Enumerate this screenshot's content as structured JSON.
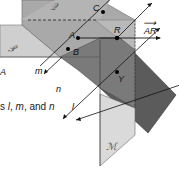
{
  "figure": {
    "planes": [
      {
        "name": "P",
        "script_label": "𝒫",
        "fill": "#c9c9c9"
      },
      {
        "name": "Q",
        "script_label": "𝒬",
        "fill": "#a8a8a8"
      },
      {
        "name": "M",
        "script_label": "ℳ",
        "fill": "#d8d8d8"
      },
      {
        "name": "dark",
        "fill": "#5a5a5a"
      }
    ],
    "points": [
      {
        "label": "C"
      },
      {
        "label": "A"
      },
      {
        "label": "B"
      },
      {
        "label": "R"
      },
      {
        "label": "Y"
      }
    ],
    "lines": [
      {
        "label": "m"
      },
      {
        "label": "n"
      },
      {
        "label": "l"
      }
    ],
    "ray_label": "AR",
    "ray_overbar": "⟶",
    "left_letter": "A",
    "caption": {
      "prefix": "s ",
      "l": "l",
      "sep1": ", ",
      "m": "m",
      "sep2": ", and ",
      "n": "n"
    }
  }
}
